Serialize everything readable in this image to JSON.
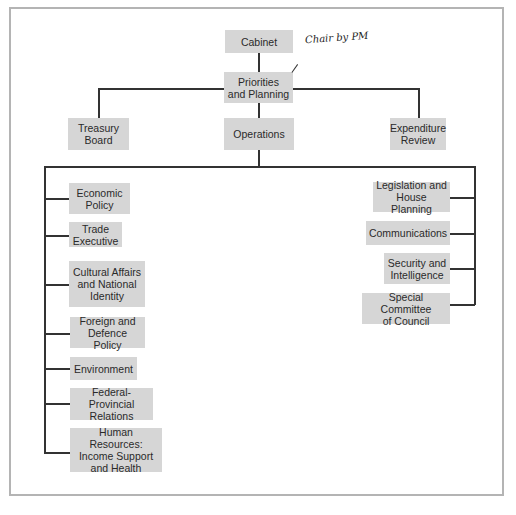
{
  "diagram": {
    "type": "org-chart",
    "top": {
      "label": "Cabinet"
    },
    "center": {
      "label": "Priorities\nand Planning",
      "annotation": "Chair by PM"
    },
    "second_row": [
      {
        "label": "Treasury\nBoard"
      },
      {
        "label": "Operations"
      },
      {
        "label": "Expenditure\nReview"
      }
    ],
    "left_committees": [
      {
        "label": "Economic\nPolicy"
      },
      {
        "label": "Trade\nExecutive"
      },
      {
        "label": "Cultural Affairs\nand National\nIdentity"
      },
      {
        "label": "Foreign and\nDefence Policy"
      },
      {
        "label": "Environment"
      },
      {
        "label": "Federal-Provincial\nRelations"
      },
      {
        "label": "Human Resources:\nIncome Support\nand Health"
      }
    ],
    "right_committees": [
      {
        "label": "Legislation and\nHouse Planning"
      },
      {
        "label": "Communications"
      },
      {
        "label": "Security and\nIntelligence"
      },
      {
        "label": "Special Committee\nof Council"
      }
    ]
  },
  "colors": {
    "box_fill": "#d6d6d6",
    "line": "#333333",
    "frame": "#b4b4b4"
  }
}
